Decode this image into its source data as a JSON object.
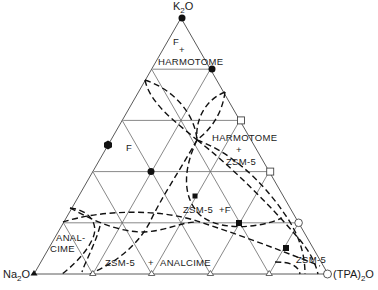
{
  "vertices": {
    "top": {
      "label": "K",
      "sub": "2",
      "tail": "O"
    },
    "left": {
      "label": "Na",
      "sub": "2",
      "tail": "O"
    },
    "right": {
      "label": "(TPA)",
      "sub": "2",
      "tail": "O"
    }
  },
  "regions": {
    "f_top": "F",
    "plus_top": "+",
    "harmotome_top": "HARMOTOME",
    "f_left": "F",
    "harmotome_mid": "HARMOTOME",
    "plus_mid": "+",
    "zsm5_mid": "ZSM-5",
    "zsm5_f": "ZSM-5  +F",
    "anal": "ANAL-",
    "cime": "CIME",
    "zsm5_bottom": "ZSM-5",
    "plus_bottom": "+",
    "analcime_bottom": "ANALCIME",
    "zsm5_right": "ZSM-5"
  },
  "colors": {
    "grid": "#6a6a6a",
    "boundary": "#111111",
    "marker": "#111111"
  },
  "grid_divisions": 5,
  "markers": [
    {
      "shape": "circle-filled",
      "x": 182,
      "y": 18
    },
    {
      "shape": "circle-filled",
      "x": 212,
      "y": 69
    },
    {
      "shape": "hexagon-filled",
      "x": 108,
      "y": 145
    },
    {
      "shape": "circle-filled",
      "x": 151,
      "y": 171
    },
    {
      "shape": "square-open",
      "x": 241,
      "y": 120
    },
    {
      "shape": "square-open",
      "x": 270,
      "y": 172
    },
    {
      "shape": "circle-open",
      "x": 298,
      "y": 223
    },
    {
      "shape": "circle-open",
      "x": 327,
      "y": 274
    },
    {
      "shape": "square-filled",
      "x": 195,
      "y": 196
    },
    {
      "shape": "square-filled",
      "x": 239,
      "y": 224
    },
    {
      "shape": "square-filled",
      "x": 286,
      "y": 248
    },
    {
      "shape": "triangle-filled",
      "x": 34,
      "y": 273
    },
    {
      "shape": "triangle-open",
      "x": 91,
      "y": 273
    },
    {
      "shape": "triangle-open",
      "x": 150,
      "y": 273
    },
    {
      "shape": "triangle-open",
      "x": 209,
      "y": 273
    },
    {
      "shape": "triangle-open",
      "x": 269,
      "y": 273
    }
  ]
}
